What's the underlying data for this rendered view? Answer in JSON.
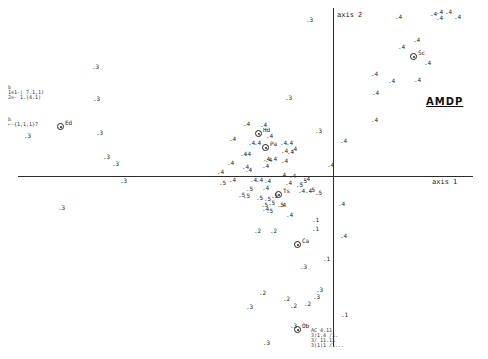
{
  "chart_data": {
    "type": "scatter",
    "title": "AMDP",
    "xlabel": "axis 1",
    "ylabel": "axis 2",
    "grid": false,
    "legend": null,
    "origin_px": {
      "x": 333,
      "y": 176
    },
    "xlim_px": [
      20,
      470
    ],
    "ylim_px": [
      8,
      345
    ],
    "annotations": [
      {
        "text": "Ed",
        "x": 61,
        "y": 127,
        "circled": true
      },
      {
        "text": "Sc",
        "x": 414,
        "y": 57,
        "circled": true
      },
      {
        "text": "Ca",
        "x": 298,
        "y": 245,
        "circled": true
      },
      {
        "text": "Ob",
        "x": 298,
        "y": 330,
        "circled": true
      },
      {
        "text": "Hd",
        "x": 259,
        "y": 134,
        "circled": true
      },
      {
        "text": "Pa",
        "x": 266,
        "y": 148,
        "circled": true
      },
      {
        "text": "Ts",
        "x": 279,
        "y": 195,
        "circled": true
      }
    ],
    "points": [
      {
        "label": "3",
        "x": 92,
        "y": 67
      },
      {
        "label": "3",
        "x": 93,
        "y": 99
      },
      {
        "label": "3",
        "x": 96,
        "y": 133
      },
      {
        "label": "3",
        "x": 103,
        "y": 157
      },
      {
        "label": "3",
        "x": 112,
        "y": 164
      },
      {
        "label": "3",
        "x": 24,
        "y": 136
      },
      {
        "label": "3",
        "x": 120,
        "y": 181
      },
      {
        "label": "3",
        "x": 58,
        "y": 208
      },
      {
        "label": "3",
        "x": 285,
        "y": 98
      },
      {
        "label": "3",
        "x": 306,
        "y": 20
      },
      {
        "label": "3",
        "x": 315,
        "y": 131
      },
      {
        "label": "3",
        "x": 300,
        "y": 267
      },
      {
        "label": "3",
        "x": 316,
        "y": 290
      },
      {
        "label": "3",
        "x": 313,
        "y": 297
      },
      {
        "label": "3",
        "x": 246,
        "y": 307
      },
      {
        "label": "3",
        "x": 290,
        "y": 326
      },
      {
        "label": "3",
        "x": 263,
        "y": 343
      },
      {
        "label": "2",
        "x": 270,
        "y": 231
      },
      {
        "label": "2",
        "x": 254,
        "y": 231
      },
      {
        "label": "2",
        "x": 259,
        "y": 293
      },
      {
        "label": "2",
        "x": 283,
        "y": 299
      },
      {
        "label": "2",
        "x": 290,
        "y": 306
      },
      {
        "label": "2",
        "x": 304,
        "y": 304
      },
      {
        "label": "1",
        "x": 312,
        "y": 220
      },
      {
        "label": "1",
        "x": 312,
        "y": 229
      },
      {
        "label": "1",
        "x": 323,
        "y": 259
      },
      {
        "label": "1",
        "x": 341,
        "y": 315
      },
      {
        "label": "4",
        "x": 340,
        "y": 236
      },
      {
        "label": "4",
        "x": 327,
        "y": 165
      },
      {
        "label": "4",
        "x": 338,
        "y": 204
      },
      {
        "label": "4",
        "x": 340,
        "y": 141
      },
      {
        "label": "4",
        "x": 371,
        "y": 74
      },
      {
        "label": "4",
        "x": 372,
        "y": 93
      },
      {
        "label": "4",
        "x": 371,
        "y": 120
      },
      {
        "label": "4",
        "x": 388,
        "y": 81
      },
      {
        "label": "4",
        "x": 414,
        "y": 80
      },
      {
        "label": "4",
        "x": 424,
        "y": 63
      },
      {
        "label": "4",
        "x": 413,
        "y": 40
      },
      {
        "label": "4",
        "x": 395,
        "y": 17
      },
      {
        "label": "4",
        "x": 430,
        "y": 14
      },
      {
        "label": "4",
        "x": 436,
        "y": 12
      },
      {
        "label": "4",
        "x": 445,
        "y": 12
      },
      {
        "label": "4",
        "x": 436,
        "y": 18
      },
      {
        "label": "4",
        "x": 454,
        "y": 17
      },
      {
        "label": "4",
        "x": 398,
        "y": 47
      },
      {
        "label": "4",
        "x": 229,
        "y": 139
      },
      {
        "label": "4",
        "x": 243,
        "y": 124
      },
      {
        "label": "4",
        "x": 260,
        "y": 125
      },
      {
        "label": "4",
        "x": 266,
        "y": 136
      },
      {
        "label": "4",
        "x": 248,
        "y": 143
      },
      {
        "label": "4",
        "x": 254,
        "y": 143
      },
      {
        "label": "4",
        "x": 280,
        "y": 143
      },
      {
        "label": "4",
        "x": 286,
        "y": 143
      },
      {
        "label": "4",
        "x": 281,
        "y": 151
      },
      {
        "label": "4",
        "x": 290,
        "y": 149
      },
      {
        "label": "4",
        "x": 281,
        "y": 161
      },
      {
        "label": "4",
        "x": 287,
        "y": 152
      },
      {
        "label": "4",
        "x": 279,
        "y": 175
      },
      {
        "label": "4",
        "x": 289,
        "y": 176
      },
      {
        "label": "4",
        "x": 285,
        "y": 183
      },
      {
        "label": "4",
        "x": 303,
        "y": 179
      },
      {
        "label": "4",
        "x": 265,
        "y": 160
      },
      {
        "label": "4",
        "x": 270,
        "y": 159
      },
      {
        "label": "4",
        "x": 240,
        "y": 154
      },
      {
        "label": "4",
        "x": 244,
        "y": 154
      },
      {
        "label": "4",
        "x": 227,
        "y": 163
      },
      {
        "label": "4",
        "x": 242,
        "y": 167
      },
      {
        "label": "4",
        "x": 245,
        "y": 170
      },
      {
        "label": "4",
        "x": 262,
        "y": 166
      },
      {
        "label": "4",
        "x": 263,
        "y": 159
      },
      {
        "label": "4",
        "x": 217,
        "y": 172
      },
      {
        "label": "4",
        "x": 229,
        "y": 180
      },
      {
        "label": "4",
        "x": 250,
        "y": 180
      },
      {
        "label": "4",
        "x": 256,
        "y": 180
      },
      {
        "label": "4",
        "x": 264,
        "y": 181
      },
      {
        "label": "4",
        "x": 262,
        "y": 188
      },
      {
        "label": "4",
        "x": 298,
        "y": 191
      },
      {
        "label": "4",
        "x": 305,
        "y": 191
      },
      {
        "label": "4",
        "x": 279,
        "y": 205
      },
      {
        "label": "4",
        "x": 286,
        "y": 215
      },
      {
        "label": "4",
        "x": 262,
        "y": 209
      },
      {
        "label": "5",
        "x": 246,
        "y": 189
      },
      {
        "label": "5",
        "x": 238,
        "y": 195
      },
      {
        "label": "5",
        "x": 243,
        "y": 196
      },
      {
        "label": "5",
        "x": 271,
        "y": 196
      },
      {
        "label": "5",
        "x": 277,
        "y": 205
      },
      {
        "label": "5",
        "x": 268,
        "y": 203
      },
      {
        "label": "5",
        "x": 264,
        "y": 199
      },
      {
        "label": "5",
        "x": 256,
        "y": 198
      },
      {
        "label": "5",
        "x": 261,
        "y": 205
      },
      {
        "label": "5",
        "x": 266,
        "y": 211
      },
      {
        "label": "5",
        "x": 315,
        "y": 193
      },
      {
        "label": "5",
        "x": 308,
        "y": 190
      },
      {
        "label": "5",
        "x": 296,
        "y": 185
      },
      {
        "label": "5",
        "x": 300,
        "y": 181
      },
      {
        "label": "5",
        "x": 219,
        "y": 183
      }
    ],
    "side_notes": [
      {
        "text": "b\n1=1-( 7.1,1)\n2=- 1.(4.1)",
        "x": 8,
        "y": 85
      },
      {
        "text": "b\n←-{1,1,1}7",
        "x": 8,
        "y": 117
      },
      {
        "text": "AC 4.11\n3)1.4 /1.\n3/ 11.11\n3(1)1 /1...",
        "x": 311,
        "y": 328
      }
    ]
  }
}
